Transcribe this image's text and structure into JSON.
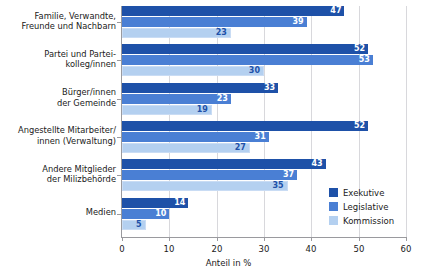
{
  "chart_data": {
    "type": "bar",
    "orientation": "horizontal",
    "title": "",
    "xlabel": "Anteil in %",
    "ylabel": "",
    "xlim": [
      0,
      60
    ],
    "xticks": [
      0,
      10,
      20,
      30,
      40,
      50,
      60
    ],
    "grid": "vertical",
    "legend_position": "inside-bottom-right",
    "categories": [
      "Familie, Verwandte,\nFreunde und Nachbarn",
      "Partei und Partei-\nkolleg/innen",
      "Bürger/innen\nder Gemeinde",
      "Angestellte Mitarbeiter/\ninnen (Verwaltung)",
      "Andere Mitglieder\nder Milizbehörde",
      "Medien"
    ],
    "category_lines": [
      [
        "Familie, Verwandte,",
        "Freunde und Nachbarn"
      ],
      [
        "Partei und Partei-",
        "kolleg/innen"
      ],
      [
        "Bürger/innen",
        "der Gemeinde"
      ],
      [
        "Angestellte Mitarbeiter/",
        "innen (Verwaltung)"
      ],
      [
        "Andere Mitglieder",
        "der Milizbehörde"
      ],
      [
        "Medien",
        ""
      ]
    ],
    "series": [
      {
        "name": "Exekutive",
        "color": "#1e51a8",
        "values": [
          47,
          52,
          33,
          52,
          43,
          14
        ]
      },
      {
        "name": "Legislative",
        "color": "#4a7fd4",
        "values": [
          39,
          53,
          23,
          31,
          37,
          10
        ]
      },
      {
        "name": "Kommission",
        "color": "#b4d0f0",
        "values": [
          23,
          30,
          19,
          27,
          35,
          5
        ]
      }
    ]
  },
  "axis": {
    "x_title": "Anteil in %",
    "x_tick_labels": [
      "0",
      "10",
      "20",
      "30",
      "40",
      "50",
      "60"
    ]
  },
  "legend": {
    "items": [
      {
        "label": "Exekutive"
      },
      {
        "label": "Legislative"
      },
      {
        "label": "Kommission"
      }
    ]
  },
  "colors": {
    "series_exekutive": "#1e51a8",
    "series_legislative": "#4a7fd4",
    "series_kommission": "#b4d0f0",
    "gridline": "#d8d8dc",
    "axis": "#9a9a9e",
    "background": "#ffffff",
    "text": "#1a1a1a"
  }
}
